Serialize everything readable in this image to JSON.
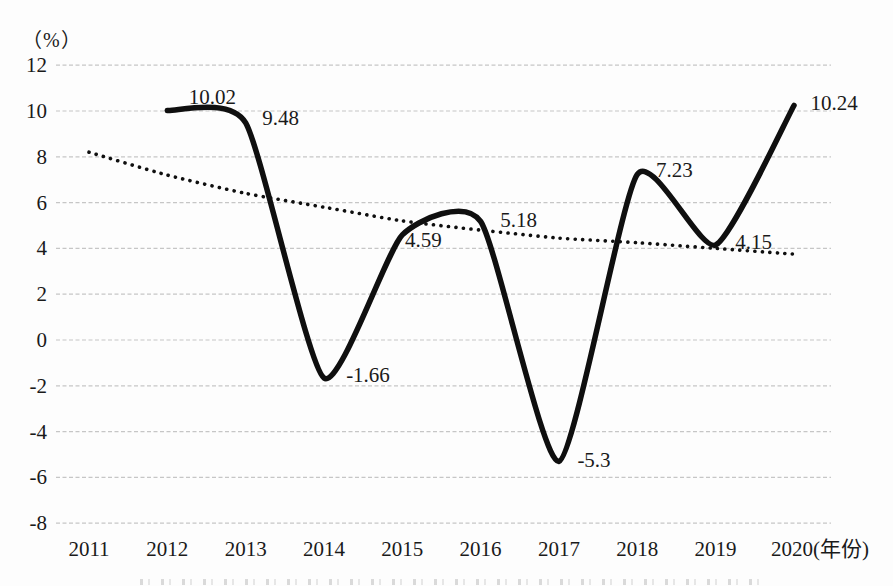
{
  "chart_data": {
    "type": "line",
    "title": "",
    "y_axis": {
      "unit_label": "（%）",
      "ticks": [
        "12",
        "10",
        "8",
        "6",
        "4",
        "2",
        "0",
        "-2",
        "-4",
        "-6",
        "-8"
      ],
      "tick_values": [
        12,
        10,
        8,
        6,
        4,
        2,
        0,
        -2,
        -4,
        -6,
        -8
      ],
      "range": [
        -8,
        12
      ],
      "gridlines": "dashed-horizontal"
    },
    "x_axis": {
      "suffix_label": "(年份)",
      "tick_labels": [
        "2011",
        "2012",
        "2013",
        "2014",
        "2015",
        "2016",
        "2017",
        "2018",
        "2019",
        "2020(年份)"
      ],
      "years": [
        2011,
        2012,
        2013,
        2014,
        2015,
        2016,
        2017,
        2018,
        2019,
        2020
      ]
    },
    "series": [
      {
        "name": "growth-rate",
        "style": "solid-smooth",
        "color": "#0f0f0f",
        "stroke_width": 5.5,
        "points": [
          {
            "year": 2012,
            "value": 10.02,
            "label": "10.02"
          },
          {
            "year": 2013,
            "value": 9.48,
            "label": "9.48"
          },
          {
            "year": 2014,
            "value": -1.66,
            "label": "-1.66"
          },
          {
            "year": 2015,
            "value": 4.59,
            "label": "4.59"
          },
          {
            "year": 2016,
            "value": 5.18,
            "label": "5.18"
          },
          {
            "year": 2017,
            "value": -5.3,
            "label": "-5.3"
          },
          {
            "year": 2018,
            "value": 7.23,
            "label": "7.23"
          },
          {
            "year": 2019,
            "value": 4.15,
            "label": "4.15"
          },
          {
            "year": 2020,
            "value": 10.24,
            "label": "10.24"
          }
        ]
      },
      {
        "name": "declining-trend",
        "style": "dotted-smooth",
        "color": "#0f0f0f",
        "stroke_width": 3.6,
        "estimated": true,
        "points": [
          {
            "year": 2011,
            "value": 8.2
          },
          {
            "year": 2012,
            "value": 7.2
          },
          {
            "year": 2013,
            "value": 6.4
          },
          {
            "year": 2014,
            "value": 5.8
          },
          {
            "year": 2015,
            "value": 5.2
          },
          {
            "year": 2016,
            "value": 4.8
          },
          {
            "year": 2017,
            "value": 4.45
          },
          {
            "year": 2018,
            "value": 4.25
          },
          {
            "year": 2019,
            "value": 4.0
          },
          {
            "year": 2020,
            "value": 3.75
          }
        ]
      }
    ],
    "grid_color": "#c6c6c6",
    "background": "#fdfdfd",
    "legend": "none"
  }
}
